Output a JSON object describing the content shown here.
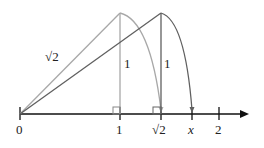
{
  "diagram": {
    "type": "number-line-construction",
    "colors": {
      "axis": "#111111",
      "first_triangle": "#a8a8a8",
      "second_triangle": "#606060"
    },
    "axis": {
      "ticks": [
        {
          "label": "0",
          "value": 0
        },
        {
          "label": "1",
          "value": 1
        },
        {
          "label": "√2",
          "value": 1.414
        },
        {
          "label": "x",
          "value": 1.732
        },
        {
          "label": "2",
          "value": 2
        }
      ]
    },
    "labels": {
      "hypotenuse": "√2",
      "leg_first": "1",
      "leg_second": "1"
    }
  }
}
